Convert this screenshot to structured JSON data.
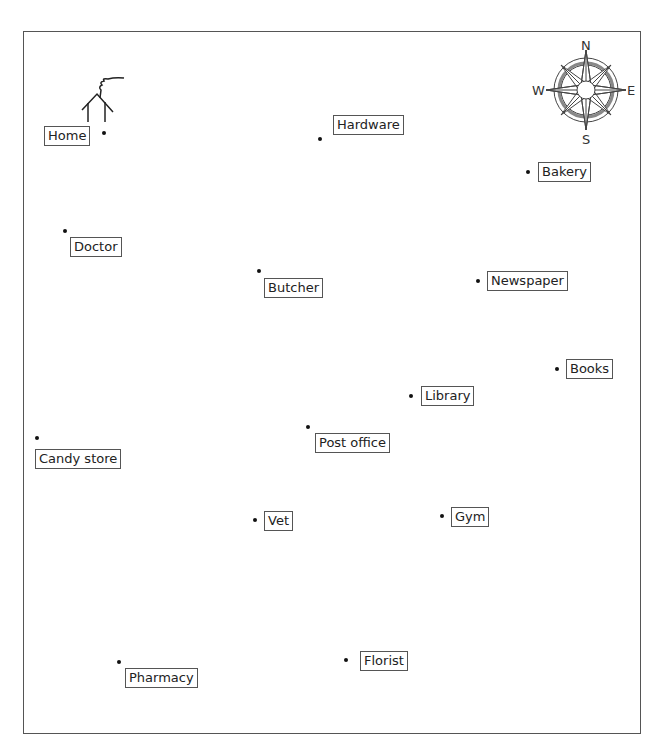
{
  "map": {
    "home_icon": "house-with-smoke-icon",
    "compass": {
      "icon": "compass-rose-icon",
      "n": "N",
      "s": "S",
      "e": "E",
      "w": "W"
    },
    "places": [
      {
        "name": "Home",
        "dot": [
          104,
          133
        ],
        "label": [
          44,
          126
        ]
      },
      {
        "name": "Hardware",
        "dot": [
          320,
          139
        ],
        "label": [
          333,
          115
        ]
      },
      {
        "name": "Bakery",
        "dot": [
          528,
          172
        ],
        "label": [
          538,
          162
        ]
      },
      {
        "name": "Doctor",
        "dot": [
          65,
          231
        ],
        "label": [
          70,
          237
        ]
      },
      {
        "name": "Butcher",
        "dot": [
          259,
          271
        ],
        "label": [
          264,
          278
        ]
      },
      {
        "name": "Newspaper",
        "dot": [
          478,
          281
        ],
        "label": [
          487,
          271
        ]
      },
      {
        "name": "Books",
        "dot": [
          557,
          369
        ],
        "label": [
          566,
          359
        ]
      },
      {
        "name": "Library",
        "dot": [
          411,
          396
        ],
        "label": [
          421,
          386
        ]
      },
      {
        "name": "Post office",
        "dot": [
          308,
          427
        ],
        "label": [
          315,
          433
        ]
      },
      {
        "name": "Candy store",
        "dot": [
          37,
          438
        ],
        "label": [
          35,
          449
        ]
      },
      {
        "name": "Vet",
        "dot": [
          255,
          520
        ],
        "label": [
          264,
          511
        ]
      },
      {
        "name": "Gym",
        "dot": [
          442,
          516
        ],
        "label": [
          451,
          507
        ]
      },
      {
        "name": "Florist",
        "dot": [
          346,
          660
        ],
        "label": [
          360,
          651
        ]
      },
      {
        "name": "Pharmacy",
        "dot": [
          119,
          662
        ],
        "label": [
          125,
          668
        ]
      }
    ]
  }
}
